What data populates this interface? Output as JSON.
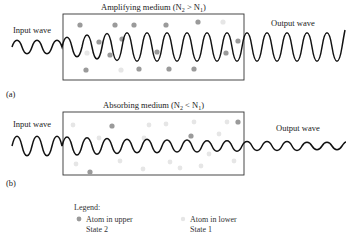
{
  "panel_a": {
    "label": "(a)",
    "title": "Amplifying medium (N",
    "title_full": "Amplifying medium (N2 > N1)",
    "title_sub2": "2",
    "title_mid": " > N",
    "title_sub1": "1",
    "title_end": ")",
    "input_label": "Input wave",
    "output_label": "Output wave"
  },
  "panel_b": {
    "label": "(b)",
    "title": "Absorbing medium (N",
    "title_full": "Absorbing medium (N2 < N1)",
    "title_sub2": "2",
    "title_mid": " < N",
    "title_sub1": "1",
    "title_end": ")",
    "input_label": "Input wave",
    "output_label": "Output wave"
  },
  "legend": {
    "title": "Legend:",
    "upper_line1": "Atom in upper",
    "upper_line2": "State 2",
    "lower_line1": "Atom in lower",
    "lower_line2": "State 1"
  },
  "colors": {
    "upper_state_atom": "#9a9a9a",
    "lower_state_atom": "#e6e6e6",
    "wave": "#111111",
    "box": "#333333"
  }
}
